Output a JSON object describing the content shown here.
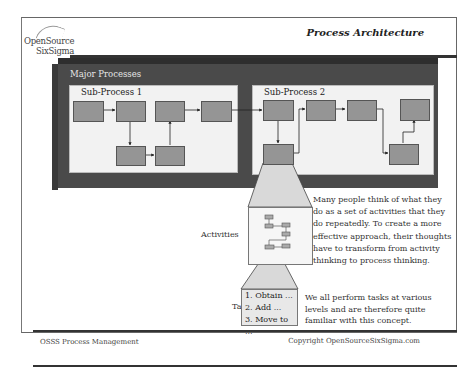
{
  "header": {
    "logo_line1": "OpenSource",
    "logo_line2": "SixSigma",
    "title": "Process Architecture"
  },
  "diagram": {
    "major_label": "Major Processes",
    "sub_process_1": "Sub-Process 1",
    "sub_process_2": "Sub-Process 2",
    "activities_label": "Activities",
    "tasks_label": "Tasks",
    "tasks": [
      "1. Obtain ...",
      "2. Add ...",
      "3. Move to ..."
    ],
    "colors": {
      "major_bg": "#4a4a4a",
      "sub_bg": "#f2f2f2",
      "box_fill": "#959595",
      "funnel_fill": "#d9d9d9"
    }
  },
  "text": {
    "activities_desc": "Many people think of what they do as a set of activities that they do repeatedly. To create a more effective approach, their thoughts have to transform from activity thinking to process thinking.",
    "tasks_desc": "We all perform tasks at various levels and are therefore quite familiar with this concept."
  },
  "footer": {
    "left": "OSSS Process Management",
    "right": "Copyright  OpenSourceSixSigma.com"
  }
}
